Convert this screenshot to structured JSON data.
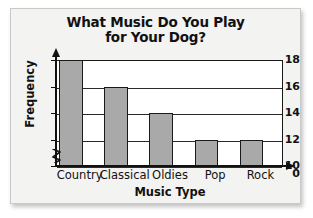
{
  "chart_data": {
    "type": "bar",
    "title": "What Music Do You Play for Your Dog?",
    "title_line1": "What Music Do You Play",
    "title_line2": "for Your Dog?",
    "xlabel": "Music Type",
    "ylabel": "Frequency",
    "categories": [
      "Country",
      "Classical",
      "Oldies",
      "Pop",
      "Rock"
    ],
    "values": [
      18,
      16,
      14,
      12,
      12
    ],
    "yticks": [
      18,
      16,
      14,
      12,
      10,
      0
    ],
    "ylim": [
      10,
      18
    ],
    "y_axis_break": true,
    "y_axis_break_between": [
      0,
      10
    ],
    "grid": true,
    "legend": false,
    "bar_color": "#a9a9a9",
    "bar_edge_color": "#1a1a1a",
    "axis_color": "#111111",
    "plot_background": "#ffffff",
    "figure_background": "#f3f3f1"
  }
}
